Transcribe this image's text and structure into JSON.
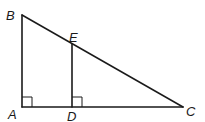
{
  "diagram": {
    "type": "geometry",
    "stroke_color": "#1a1a1a",
    "points": {
      "A": {
        "label": "A",
        "x": 22,
        "y": 107
      },
      "B": {
        "label": "B",
        "x": 22,
        "y": 15
      },
      "C": {
        "label": "C",
        "x": 183,
        "y": 107
      },
      "D": {
        "label": "D",
        "x": 72,
        "y": 107
      },
      "E": {
        "label": "E",
        "x": 72,
        "y": 44
      }
    },
    "segments": [
      {
        "name": "AB",
        "from": "A",
        "to": "B"
      },
      {
        "name": "AC",
        "from": "A",
        "to": "C"
      },
      {
        "name": "BC",
        "from": "B",
        "to": "C"
      },
      {
        "name": "DE",
        "from": "D",
        "to": "E"
      }
    ],
    "right_angles": [
      {
        "at": "A",
        "size": 10
      },
      {
        "at": "D",
        "size": 10
      }
    ]
  }
}
